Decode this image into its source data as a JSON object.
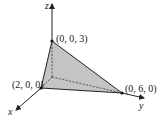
{
  "figure": {
    "type": "3d-tetrahedron",
    "colors": {
      "face_fill": "#c4c4c4",
      "edge": "#222222",
      "background": "#ffffff"
    },
    "axes": {
      "x": {
        "label": "x"
      },
      "y": {
        "label": "y"
      },
      "z": {
        "label": "z"
      }
    },
    "points": [
      {
        "label": "(0, 0, 3)",
        "coords": [
          0,
          0,
          3
        ]
      },
      {
        "label": "(2, 0, 0)",
        "coords": [
          2,
          0,
          0
        ]
      },
      {
        "label": "(0, 6, 0)",
        "coords": [
          0,
          6,
          0
        ]
      }
    ]
  }
}
